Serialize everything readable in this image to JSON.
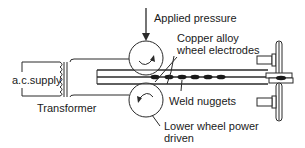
{
  "diagram": {
    "labels": {
      "applied_pressure": "Applied pressure",
      "electrodes_line1": "Copper alloy",
      "electrodes_line2": "wheel electrodes",
      "ac_supply": "a.c.supply",
      "transformer": "Transformer",
      "weld_nuggets": "Weld nuggets",
      "lower_wheel_line1": "Lower wheel power",
      "lower_wheel_line2": "driven"
    },
    "colors": {
      "line": "#2a2a2a",
      "background": "#ffffff"
    },
    "nugget_count": 6
  }
}
